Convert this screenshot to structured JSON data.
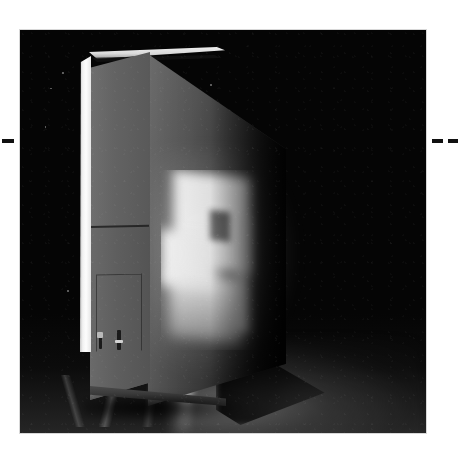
{
  "page": {
    "kind": "scanned-photograph-plate",
    "background_color": "#ffffff",
    "width": 458,
    "height": 450
  },
  "crop_marks": {
    "name": "registration-dashes",
    "color": "#111111",
    "axis_y": 141,
    "left": [
      {
        "x": 2,
        "width": 12
      }
    ],
    "right": [
      {
        "x": 424,
        "width": 3
      },
      {
        "x": 432,
        "width": 11
      },
      {
        "x": 448,
        "width": 10
      }
    ]
  },
  "photo": {
    "name": "black-and-white-photograph",
    "x": 20,
    "y": 30,
    "width": 406,
    "height": 403,
    "background_color": "#050505",
    "subject": "large freestanding panel screen in a dark room",
    "palette": {
      "room_black": "#050505",
      "side_face_gray": "#636363",
      "front_face_gray": "#4a4a4a",
      "lit_edge_white": "#fdfdfd",
      "projection_white": "#fbfbfb",
      "projection_window_gray": "#4a4a4a",
      "floor_gray": "#5a5a5a"
    },
    "elements": {
      "edge_strip": "bright lit vertical strip on left edge of panel",
      "side_face": "narrow gray return/side face of the panel",
      "side_seam": "horizontal seam dividing upper and lower side face",
      "access_panel": "inset rectangular access panel outline, lower side face",
      "latches": "two small dark latch or handle fittings",
      "top_rim": "bright lit rim along top of panel",
      "front_face": "wide angled front face receding into darkness",
      "projection": "bright projected rectangle of light with darker inner window",
      "floor_glow": "soft pool of reflected light on the floor",
      "floor_streak": "narrow vertical specular reflection on the floor",
      "cast_shadow": "shadow cast to the right of the panel base",
      "specks": "faint dust specks in the dark room"
    }
  }
}
